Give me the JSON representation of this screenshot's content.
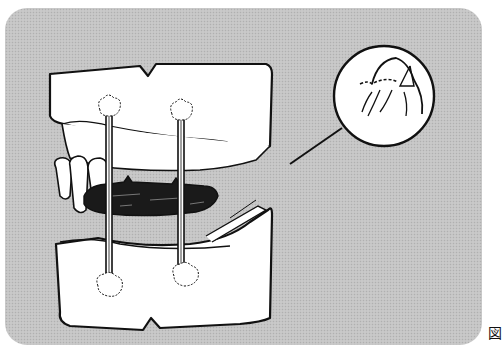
{
  "figure": {
    "label": "図",
    "elements": {
      "upper_model": "upper-jaw-cast",
      "lower_model": "lower-jaw-cast",
      "bite_record": "wax-bite-registration",
      "sticks": [
        "stick-left",
        "stick-right"
      ],
      "inset": "magnified-detail-circle"
    }
  },
  "colors": {
    "panel_background": "#c4c4c4",
    "line": "#111111",
    "cast_fill": "#ffffff",
    "bite_fill": "#1a1a1a"
  }
}
